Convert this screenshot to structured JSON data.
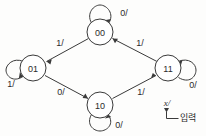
{
  "diagram": {
    "type": "state-transition-diagram",
    "title": "",
    "background_color": "#fdfdfc",
    "line_color": "#3a3a3a",
    "text_color": "#2b2b2b",
    "states": [
      {
        "id": "s00",
        "label": "00",
        "cx": 100,
        "cy": 32,
        "r": 13
      },
      {
        "id": "s01",
        "label": "01",
        "cx": 33,
        "cy": 68,
        "r": 13
      },
      {
        "id": "s11",
        "label": "11",
        "cx": 168,
        "cy": 68,
        "r": 13
      },
      {
        "id": "s10",
        "label": "10",
        "cx": 100,
        "cy": 105,
        "r": 13
      }
    ],
    "self_loops": [
      {
        "id": "loop00",
        "state": "00",
        "label": "0/",
        "position": "top",
        "label_x": 124,
        "label_y": 13
      },
      {
        "id": "loop01",
        "state": "01",
        "label": "1/",
        "position": "left",
        "label_x": 11,
        "label_y": 84
      },
      {
        "id": "loop11",
        "state": "11",
        "label": "0/",
        "position": "right",
        "label_x": 193,
        "label_y": 85
      },
      {
        "id": "loop10",
        "state": "10",
        "label": "0/",
        "position": "bottom",
        "label_x": 119,
        "label_y": 125
      }
    ],
    "transitions": [
      {
        "id": "t00_01",
        "from": "00",
        "to": "01",
        "label": "1/",
        "label_x": 60,
        "label_y": 43
      },
      {
        "id": "t01_10",
        "from": "01",
        "to": "10",
        "label": "0/",
        "label_x": 61,
        "label_y": 92
      },
      {
        "id": "t10_11",
        "from": "10",
        "to": "11",
        "label": "1/",
        "label_x": 141,
        "label_y": 92
      },
      {
        "id": "t11_00",
        "from": "11",
        "to": "00",
        "label": "1/",
        "label_x": 140,
        "label_y": 43
      }
    ],
    "legend": {
      "variable": "x/",
      "variable_x": 167,
      "variable_y": 103,
      "description": "입력",
      "description_x": 180,
      "description_y": 118
    }
  }
}
